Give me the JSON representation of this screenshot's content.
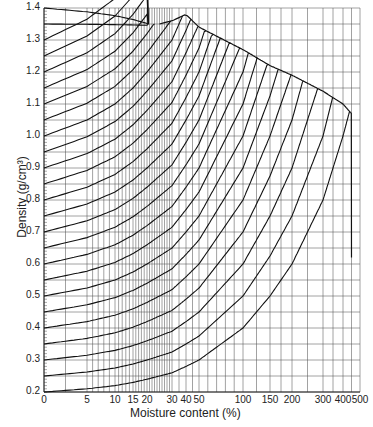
{
  "chart_data": {
    "type": "line",
    "title": "",
    "xlabel": "Moisture content (%)",
    "ylabel": "Density (g/cm³)",
    "x_tick_labels": [
      "0",
      "5",
      "10",
      "15",
      "20",
      "30",
      "40",
      "50",
      "100",
      "150",
      "200",
      "300",
      "400",
      "500"
    ],
    "x_tick_px": [
      44,
      87,
      115,
      133,
      147,
      172,
      186,
      199,
      243,
      270,
      292,
      323,
      343,
      360
    ],
    "y_tick_labels": [
      "1.4",
      "1.3",
      "1.2",
      "1.1",
      "1.0",
      "0.9",
      "0.8",
      "0.7",
      "0.6",
      "0.5",
      "0.4",
      "0.3",
      "0.2"
    ],
    "ylim": [
      0.2,
      1.4
    ],
    "grid": true,
    "series_description": "Family of curves starting at each 0.05 g/cm3 dry density (0.2–1.4) at 0% moisture; each rises with moisture content and terminates on a saturation envelope that peaks near 1.38 at ~40% and falls to ~1.07 at ~450%",
    "start_densities": [
      0.2,
      0.25,
      0.3,
      0.35,
      0.4,
      0.45,
      0.5,
      0.55,
      0.6,
      0.65,
      0.7,
      0.75,
      0.8,
      0.85,
      0.9,
      0.95,
      1.0,
      1.05,
      1.1,
      1.15,
      1.2,
      1.25,
      1.3,
      1.35,
      1.4
    ],
    "envelope": {
      "moisture": [
        25,
        40,
        50,
        100,
        150,
        200,
        300,
        400,
        450
      ],
      "density": [
        1.35,
        1.38,
        1.34,
        1.27,
        1.22,
        1.19,
        1.14,
        1.1,
        1.07
      ]
    }
  },
  "axes": {
    "y_title": "Density (g/cm³)",
    "x_title": "Moisture content (%)"
  }
}
